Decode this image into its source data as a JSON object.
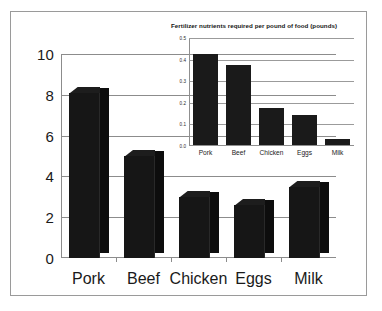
{
  "chart_data": [
    {
      "id": "main",
      "type": "bar",
      "title": "",
      "xlabel": "",
      "ylabel": "",
      "categories": [
        "Pork",
        "Beef",
        "Chicken",
        "Eggs",
        "Milk"
      ],
      "values": [
        8.1,
        5.0,
        3.0,
        2.6,
        3.5
      ],
      "ylim": [
        0,
        10
      ],
      "yticks": [
        "0",
        "2",
        "4",
        "6",
        "8",
        "10"
      ],
      "ytick_values": [
        0,
        2,
        4,
        6,
        8,
        10
      ],
      "grid": true,
      "legend": "none",
      "style": "3d-bars",
      "bar_color": "#161616"
    },
    {
      "id": "inset",
      "type": "bar",
      "title": "Fertilizer nutrients required per pound of food (pounds)",
      "xlabel": "",
      "ylabel": "",
      "categories": [
        "Pork",
        "Beef",
        "Chicken",
        "Eggs",
        "Milk"
      ],
      "values": [
        0.42,
        0.37,
        0.17,
        0.14,
        0.03
      ],
      "ylim": [
        0.0,
        0.5
      ],
      "yticks": [
        "0.0",
        "0.1",
        "0.2",
        "0.3",
        "0.4",
        "0.5"
      ],
      "ytick_values": [
        0.0,
        0.1,
        0.2,
        0.3,
        0.4,
        0.5
      ],
      "grid": true,
      "legend": "none",
      "style": "2d-bars",
      "bar_color": "#1a1a1a"
    }
  ],
  "main": {
    "yticks": [
      {
        "label": "10",
        "value": 10
      },
      {
        "label": "8",
        "value": 8
      },
      {
        "label": "6",
        "value": 6
      },
      {
        "label": "4",
        "value": 4
      },
      {
        "label": "2",
        "value": 2
      },
      {
        "label": "0",
        "value": 0
      }
    ],
    "bars": [
      {
        "label": "Pork",
        "value": 8.1
      },
      {
        "label": "Beef",
        "value": 5.0
      },
      {
        "label": "Chicken",
        "value": 3.0
      },
      {
        "label": "Eggs",
        "value": 2.6
      },
      {
        "label": "Milk",
        "value": 3.5
      }
    ]
  },
  "inset": {
    "title": "Fertilizer nutrients required per pound of food (pounds)",
    "yticks": [
      {
        "label": "0.5",
        "value": 0.5
      },
      {
        "label": "0.4",
        "value": 0.4
      },
      {
        "label": "0.3",
        "value": 0.3
      },
      {
        "label": "0.2",
        "value": 0.2
      },
      {
        "label": "0.1",
        "value": 0.1
      },
      {
        "label": "0.0",
        "value": 0.0
      }
    ],
    "bars": [
      {
        "label": "Pork",
        "value": 0.42
      },
      {
        "label": "Beef",
        "value": 0.37
      },
      {
        "label": "Chicken",
        "value": 0.17
      },
      {
        "label": "Eggs",
        "value": 0.14
      },
      {
        "label": "Milk",
        "value": 0.03
      }
    ]
  },
  "colors": {
    "frame": "#9a9a9a",
    "axis": "#8c8c8c",
    "grid": "#8c8c8c",
    "bar": "#161616",
    "text": "#1a1a1a",
    "background": "#ffffff"
  }
}
